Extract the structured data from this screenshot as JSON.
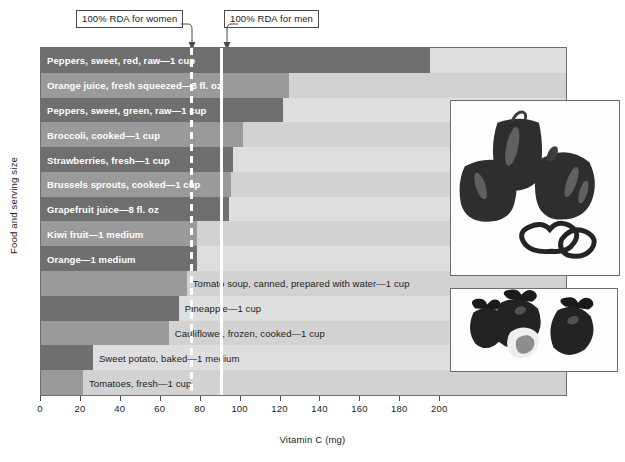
{
  "chart_data": {
    "type": "bar",
    "title": "",
    "xlabel": "Vitamin C (mg)",
    "ylabel": "Food and serving size",
    "xlim": [
      0,
      263
    ],
    "xticks": [
      0,
      20,
      40,
      60,
      80,
      100,
      120,
      140,
      160,
      180,
      200
    ],
    "xtick_labels": [
      "0",
      "20",
      "40",
      "60",
      "80",
      "100",
      "120",
      "140",
      "160",
      "180",
      "200"
    ],
    "grid": false,
    "orientation": "horizontal",
    "categories": [
      "Peppers, sweet, red, raw—1 cup",
      "Orange juice, fresh squeezed—8 fl. oz",
      "Peppers, sweet, green, raw—1 cup",
      "Broccoli, cooked—1 cup",
      "Strawberries, fresh—1 cup",
      "Brussels sprouts, cooked—1 cup",
      "Grapefruit juice—8 fl. oz",
      "Kiwi fruit—1 medium",
      "Orange—1 medium",
      "Tomato soup, canned, prepared with water—1 cup",
      "Pineapple—1 cup",
      "Cauliflower, frozen, cooked—1 cup",
      "Sweet potato, baked—1 medium",
      "Tomatoes, fresh—1 cup"
    ],
    "values": [
      195,
      124,
      121,
      101,
      96,
      95,
      94,
      78,
      78,
      73,
      69,
      64,
      26,
      21
    ],
    "label_placement": [
      "inside",
      "inside",
      "inside",
      "inside",
      "inside",
      "inside",
      "inside",
      "inside",
      "inside",
      "outside",
      "outside",
      "outside",
      "outside",
      "outside"
    ],
    "bar_shades": [
      "dark",
      "mid",
      "dark",
      "mid",
      "dark",
      "mid",
      "dark",
      "mid",
      "dark",
      "mid",
      "dark",
      "mid",
      "dark",
      "mid"
    ],
    "annotations": [
      {
        "name": "rda-women",
        "label": "100% RDA for women",
        "value": 75,
        "style": "dashed-white"
      },
      {
        "name": "rda-men",
        "label": "100% RDA for men",
        "value": 90,
        "style": "solid-white"
      }
    ],
    "insets": [
      {
        "name": "peppers-photo",
        "caption": "bell peppers photo"
      },
      {
        "name": "strawberries-photo",
        "caption": "strawberries photo"
      }
    ],
    "colors": {
      "plot_background": "#dedede",
      "plot_background_alt": "#d2d2d2",
      "bar_dark": "#6f6f6f",
      "bar_mid": "#9a9a9a",
      "guide_line": "#ffffff",
      "axis": "#4a4a4a",
      "label_inside": "#ffffff",
      "label_outside": "#1b1b1b"
    }
  }
}
